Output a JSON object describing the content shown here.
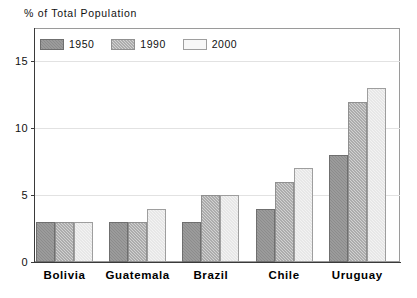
{
  "chart_data": {
    "type": "bar",
    "title": "% of Total Population",
    "xlabel": "",
    "ylabel": "",
    "categories": [
      "Bolivia",
      "Guatemala",
      "Brazil",
      "Chile",
      "Uruguay"
    ],
    "series": [
      {
        "name": "1950",
        "values": [
          3,
          3,
          3,
          4,
          8
        ],
        "color": "#8c8c8c",
        "pattern": "solid-dark-gray"
      },
      {
        "name": "1990",
        "values": [
          3,
          3,
          5,
          6,
          12
        ],
        "color": "#d2d2d2",
        "pattern": "checkered-mid-gray"
      },
      {
        "name": "2000",
        "values": [
          3,
          4,
          5,
          7,
          13
        ],
        "color": "#f3f3f3",
        "pattern": "light-near-white"
      }
    ],
    "ylim": [
      0,
      17.5
    ],
    "yticks": [
      0,
      5,
      10,
      15
    ],
    "ytick_labels": [
      "0",
      "5",
      "10",
      "15"
    ],
    "grid": true,
    "legend_position": "top-left-inside"
  },
  "legend": {
    "items": [
      {
        "label": "1950"
      },
      {
        "label": "1990"
      },
      {
        "label": "2000"
      }
    ]
  }
}
